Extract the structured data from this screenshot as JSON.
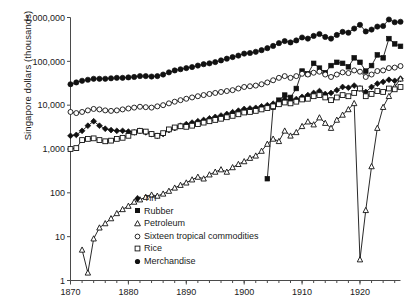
{
  "chart_data": {
    "type": "line",
    "title": "",
    "xlabel": "",
    "ylabel": "Singapore dollars (thousands)",
    "xlim": [
      1870,
      1927
    ],
    "ylim": [
      1,
      1000000
    ],
    "yscale": "log",
    "grid": false,
    "legend_position": "lower-center",
    "xticks": [
      1870,
      1880,
      1890,
      1900,
      1910,
      1920
    ],
    "xtick_labels": [
      "1870",
      "1880",
      "1890",
      "1900",
      "1910",
      "1920"
    ],
    "yticks": [
      1,
      10,
      100,
      1000,
      10000,
      100000,
      1000000
    ],
    "ytick_labels": [
      "1",
      "10",
      "100",
      "1,000",
      "10,000",
      "100,000",
      "1,000,000"
    ],
    "series": [
      {
        "name": "Tin",
        "marker": "filled-diamond",
        "x": [
          1870,
          1871,
          1872,
          1873,
          1874,
          1875,
          1876,
          1877,
          1878,
          1879,
          1880,
          1881,
          1882,
          1883,
          1884,
          1885,
          1886,
          1887,
          1888,
          1889,
          1890,
          1891,
          1892,
          1893,
          1894,
          1895,
          1896,
          1897,
          1898,
          1899,
          1900,
          1901,
          1902,
          1903,
          1904,
          1905,
          1906,
          1907,
          1908,
          1909,
          1910,
          1911,
          1912,
          1913,
          1914,
          1915,
          1916,
          1917,
          1918,
          1919,
          1920,
          1921,
          1922,
          1923,
          1924,
          1925,
          1926,
          1927
        ],
        "values": [
          2000,
          2100,
          2600,
          3400,
          4300,
          3400,
          2900,
          2700,
          2600,
          2600,
          2500,
          2400,
          2600,
          2400,
          2200,
          2000,
          2200,
          2700,
          3000,
          3400,
          3700,
          4000,
          4300,
          4600,
          5000,
          5400,
          5800,
          6300,
          6900,
          7500,
          8200,
          8400,
          8700,
          9400,
          10000,
          10800,
          12000,
          13500,
          13000,
          13800,
          15500,
          17000,
          19000,
          21000,
          18000,
          19000,
          22000,
          26000,
          25000,
          28000,
          24000,
          20000,
          26000,
          31000,
          34000,
          38000,
          36000,
          40000
        ]
      },
      {
        "name": "Rubber",
        "marker": "filled-square",
        "x": [
          1904,
          1905,
          1906,
          1907,
          1908,
          1909,
          1910,
          1911,
          1912,
          1913,
          1914,
          1915,
          1916,
          1917,
          1918,
          1919,
          1920,
          1921,
          1922,
          1923,
          1924,
          1925,
          1926,
          1927
        ],
        "values": [
          210,
          9000,
          13000,
          17000,
          15000,
          24000,
          60000,
          52000,
          90000,
          70000,
          55000,
          80000,
          95000,
          90000,
          75000,
          120000,
          95000,
          60000,
          80000,
          140000,
          120000,
          330000,
          250000,
          220000
        ]
      },
      {
        "name": "Petroleum",
        "marker": "open-triangle",
        "x": [
          1872,
          1873,
          1874,
          1875,
          1876,
          1877,
          1878,
          1879,
          1880,
          1881,
          1882,
          1883,
          1884,
          1885,
          1886,
          1887,
          1888,
          1889,
          1890,
          1891,
          1892,
          1893,
          1894,
          1895,
          1896,
          1897,
          1898,
          1899,
          1900,
          1901,
          1902,
          1903,
          1904,
          1905,
          1906,
          1907,
          1908,
          1909,
          1910,
          1911,
          1912,
          1913,
          1914,
          1915,
          1916,
          1917,
          1918,
          1919,
          1920,
          1921,
          1922,
          1923,
          1924,
          1925,
          1926,
          1927
        ],
        "values": [
          5,
          1.5,
          9,
          16,
          20,
          26,
          34,
          42,
          50,
          62,
          70,
          80,
          90,
          85,
          95,
          110,
          130,
          150,
          170,
          200,
          230,
          210,
          260,
          300,
          340,
          300,
          380,
          450,
          520,
          620,
          700,
          900,
          1300,
          1700,
          1500,
          2600,
          2000,
          2400,
          3300,
          4200,
          3600,
          5200,
          3900,
          3000,
          4600,
          6000,
          8000,
          11000,
          3,
          40,
          400,
          3000,
          9000,
          16000,
          26000,
          40000
        ]
      },
      {
        "name": "Sixteen tropical commodities",
        "marker": "open-circle",
        "x": [
          1870,
          1871,
          1872,
          1873,
          1874,
          1875,
          1876,
          1877,
          1878,
          1879,
          1880,
          1881,
          1882,
          1883,
          1884,
          1885,
          1886,
          1887,
          1888,
          1889,
          1890,
          1891,
          1892,
          1893,
          1894,
          1895,
          1896,
          1897,
          1898,
          1899,
          1900,
          1901,
          1902,
          1903,
          1904,
          1905,
          1906,
          1907,
          1908,
          1909,
          1910,
          1911,
          1912,
          1913,
          1914,
          1915,
          1916,
          1917,
          1918,
          1919,
          1920,
          1921,
          1922,
          1923,
          1924,
          1925,
          1926,
          1927
        ],
        "values": [
          7000,
          6600,
          7000,
          7600,
          8200,
          8000,
          7600,
          7400,
          7600,
          8000,
          8400,
          8800,
          9200,
          9000,
          8800,
          9400,
          10000,
          11000,
          12000,
          13000,
          14000,
          15000,
          16000,
          17000,
          18000,
          19000,
          20000,
          21000,
          22000,
          24000,
          26000,
          27000,
          28000,
          30000,
          33000,
          37000,
          42000,
          46000,
          42000,
          46000,
          52000,
          50000,
          55000,
          58000,
          50000,
          44000,
          50000,
          56000,
          54000,
          62000,
          58000,
          44000,
          50000,
          60000,
          62000,
          70000,
          72000,
          78000
        ]
      },
      {
        "name": "Rice",
        "marker": "open-square",
        "x": [
          1870,
          1871,
          1872,
          1873,
          1874,
          1875,
          1876,
          1877,
          1878,
          1879,
          1880,
          1881,
          1882,
          1883,
          1884,
          1885,
          1886,
          1887,
          1888,
          1889,
          1890,
          1891,
          1892,
          1893,
          1894,
          1895,
          1896,
          1897,
          1898,
          1899,
          1900,
          1901,
          1902,
          1903,
          1904,
          1905,
          1906,
          1907,
          1908,
          1909,
          1910,
          1911,
          1912,
          1913,
          1914,
          1915,
          1916,
          1917,
          1918,
          1919,
          1920,
          1921,
          1922,
          1923,
          1924,
          1925,
          1926,
          1927
        ],
        "values": [
          1000,
          1050,
          1600,
          1700,
          1750,
          1600,
          1500,
          1550,
          1700,
          1800,
          2000,
          2400,
          2600,
          2500,
          2200,
          2000,
          2300,
          2800,
          3100,
          3300,
          3200,
          3400,
          3700,
          4000,
          4300,
          4600,
          4900,
          5300,
          5700,
          6200,
          6800,
          7000,
          7400,
          8000,
          8600,
          9400,
          10500,
          11500,
          11000,
          12000,
          13500,
          14000,
          16000,
          17000,
          15000,
          13000,
          15000,
          17000,
          16000,
          19000,
          24000,
          16000,
          18000,
          21000,
          20000,
          24000,
          23000,
          26000
        ]
      },
      {
        "name": "Merchandise",
        "marker": "filled-circle",
        "x": [
          1870,
          1871,
          1872,
          1873,
          1874,
          1875,
          1876,
          1877,
          1878,
          1879,
          1880,
          1881,
          1882,
          1883,
          1884,
          1885,
          1886,
          1887,
          1888,
          1889,
          1890,
          1891,
          1892,
          1893,
          1894,
          1895,
          1896,
          1897,
          1898,
          1899,
          1900,
          1901,
          1902,
          1903,
          1904,
          1905,
          1906,
          1907,
          1908,
          1909,
          1910,
          1911,
          1912,
          1913,
          1914,
          1915,
          1916,
          1917,
          1918,
          1919,
          1920,
          1921,
          1922,
          1923,
          1924,
          1925,
          1926,
          1927
        ],
        "values": [
          30000,
          33000,
          36000,
          38000,
          40000,
          40000,
          40000,
          41000,
          42000,
          42000,
          43000,
          44000,
          46000,
          46000,
          45000,
          46000,
          50000,
          56000,
          62000,
          66000,
          70000,
          74000,
          80000,
          86000,
          90000,
          96000,
          105000,
          115000,
          125000,
          135000,
          150000,
          155000,
          165000,
          180000,
          200000,
          225000,
          260000,
          290000,
          270000,
          300000,
          350000,
          330000,
          380000,
          420000,
          360000,
          330000,
          400000,
          470000,
          450000,
          560000,
          680000,
          480000,
          530000,
          620000,
          640000,
          900000,
          780000,
          800000
        ]
      }
    ]
  },
  "legend": {
    "items": [
      {
        "label": "Tin",
        "marker": "filled-diamond"
      },
      {
        "label": "Rubber",
        "marker": "filled-square"
      },
      {
        "label": "Petroleum",
        "marker": "open-triangle"
      },
      {
        "label": "Sixteen tropical commodities",
        "marker": "open-circle"
      },
      {
        "label": "Rice",
        "marker": "open-square"
      },
      {
        "label": "Merchandise",
        "marker": "filled-circle"
      }
    ]
  }
}
